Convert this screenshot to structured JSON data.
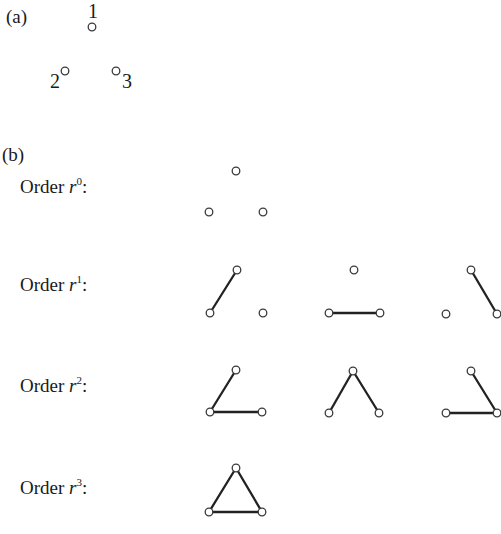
{
  "part_a": {
    "label": "(a)",
    "vertex_labels": {
      "v1": "1",
      "v2": "2",
      "v3": "3"
    }
  },
  "part_b": {
    "label": "(b)",
    "rows": [
      {
        "prefix": "Order ",
        "var": "r",
        "exp": "0",
        "suffix": ":"
      },
      {
        "prefix": "Order ",
        "var": "r",
        "exp": "1",
        "suffix": ":"
      },
      {
        "prefix": "Order ",
        "var": "r",
        "exp": "2",
        "suffix": ":"
      },
      {
        "prefix": "Order ",
        "var": "r",
        "exp": "3",
        "suffix": ":"
      }
    ]
  },
  "graphs": {
    "order_0": [
      {
        "edges": []
      }
    ],
    "order_1": [
      {
        "edges": [
          "1-2"
        ]
      },
      {
        "edges": [
          "2-3"
        ]
      },
      {
        "edges": [
          "1-3"
        ]
      }
    ],
    "order_2": [
      {
        "edges": [
          "1-2",
          "2-3"
        ]
      },
      {
        "edges": [
          "1-2",
          "1-3"
        ]
      },
      {
        "edges": [
          "1-3",
          "2-3"
        ]
      }
    ],
    "order_3": [
      {
        "edges": [
          "1-2",
          "2-3",
          "1-3"
        ]
      }
    ]
  }
}
